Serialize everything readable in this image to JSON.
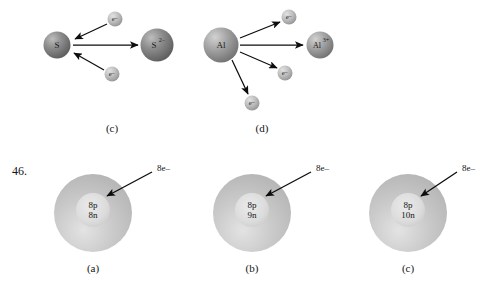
{
  "figure": {
    "item_number": "46.",
    "top_row": {
      "panels": [
        {
          "id": "panel-c",
          "caption": "(c)",
          "process": "gain",
          "reactant": {
            "symbol": "S",
            "cx": 57,
            "cy": 45,
            "r": 13.5,
            "font_size": 9,
            "shade": "dark"
          },
          "product": {
            "symbol": "S",
            "charge": "2−",
            "cx": 157,
            "cy": 45,
            "r": 16.5,
            "font_size": 9,
            "shade": "dark"
          },
          "electrons": [
            {
              "label": "e−",
              "cx": 115,
              "cy": 19,
              "r": 7.5
            },
            {
              "label": "e−",
              "cx": 112,
              "cy": 74,
              "r": 7.5
            }
          ],
          "arrows": [
            {
              "x1": 107,
              "y1": 24,
              "x2": 75,
              "y2": 39,
              "kind": "electron-in"
            },
            {
              "x1": 104,
              "y1": 70,
              "x2": 74,
              "y2": 53,
              "kind": "electron-in"
            },
            {
              "x1": 73,
              "y1": 45,
              "x2": 138,
              "y2": 45,
              "kind": "transform"
            }
          ],
          "caption_x": 112,
          "caption_y": 128
        },
        {
          "id": "panel-d",
          "caption": "(d)",
          "process": "lose",
          "reactant": {
            "symbol": "Al",
            "cx": 221,
            "cy": 45,
            "r": 17.5,
            "font_size": 9,
            "shade": "mid"
          },
          "product": {
            "symbol": "Al",
            "charge": "3+",
            "cx": 320,
            "cy": 45,
            "r": 13.5,
            "font_size": 8,
            "shade": "mid"
          },
          "electrons": [
            {
              "label": "e−",
              "cx": 289,
              "cy": 17,
              "r": 7.5
            },
            {
              "label": "e−",
              "cx": 285,
              "cy": 73,
              "r": 7.5
            },
            {
              "label": "e−",
              "cx": 252,
              "cy": 103,
              "r": 7.5
            }
          ],
          "arrows": [
            {
              "x1": 240,
              "y1": 38,
              "x2": 280,
              "y2": 22,
              "kind": "electron-out"
            },
            {
              "x1": 240,
              "y1": 52,
              "x2": 277,
              "y2": 68,
              "kind": "electron-out"
            },
            {
              "x1": 232,
              "y1": 60,
              "x2": 248,
              "y2": 94,
              "kind": "electron-out"
            },
            {
              "x1": 240,
              "y1": 45,
              "x2": 303,
              "y2": 45,
              "kind": "transform"
            }
          ],
          "caption_x": 262,
          "caption_y": 128
        }
      ]
    },
    "bottom_row": {
      "atoms": [
        {
          "id": "atom-a",
          "caption": "(a)",
          "protons": "8p",
          "neutrons": "8n",
          "electron_label": "8e–",
          "cx": 93,
          "cy": 213,
          "cloud_r": 39,
          "nucleus_r": 17,
          "label_x": 157,
          "label_y": 168,
          "arrow": {
            "x1": 152,
            "y1": 172,
            "x2": 107,
            "y2": 196
          },
          "caption_x": 93,
          "caption_y": 268
        },
        {
          "id": "atom-b",
          "caption": "(b)",
          "protons": "8p",
          "neutrons": "9n",
          "electron_label": "8e–",
          "cx": 252,
          "cy": 213,
          "cloud_r": 39,
          "nucleus_r": 17,
          "label_x": 316,
          "label_y": 168,
          "arrow": {
            "x1": 311,
            "y1": 172,
            "x2": 266,
            "y2": 196
          },
          "caption_x": 252,
          "caption_y": 268
        },
        {
          "id": "atom-c",
          "caption": "(c)",
          "protons": "8p",
          "neutrons": "10n",
          "electron_label": "8e–",
          "cx": 408,
          "cy": 213,
          "cloud_r": 39,
          "nucleus_r": 17,
          "label_x": 462,
          "label_y": 168,
          "arrow": {
            "x1": 457,
            "y1": 172,
            "x2": 421,
            "y2": 196
          },
          "caption_x": 408,
          "caption_y": 268
        }
      ]
    },
    "item_number_x": 12,
    "item_number_y": 171,
    "colors": {
      "background": "#ffffff",
      "sphere_dark": "#808080",
      "sphere_mid": "#9a9a9a",
      "sphere_light": "#c9c9c9",
      "cloud": "#b8b8b8",
      "nucleus": "#d2d2d2",
      "ink": "#111111"
    }
  }
}
